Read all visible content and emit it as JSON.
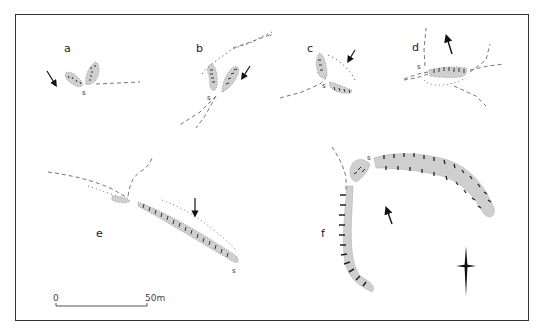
{
  "diagram": {
    "panels": [
      {
        "id": "a",
        "label": "a",
        "marker": "s"
      },
      {
        "id": "b",
        "label": "b",
        "marker": "s"
      },
      {
        "id": "c",
        "label": "c",
        "marker": "s"
      },
      {
        "id": "d",
        "label": "d",
        "marker": "s"
      },
      {
        "id": "e",
        "label": "e",
        "marker": "s"
      },
      {
        "id": "f",
        "label": "f",
        "marker": "s"
      }
    ],
    "scale_bar": {
      "start_label": "0",
      "end_label": "50m"
    },
    "north_arrow": "north-arrow-icon",
    "colors": {
      "fill": "#cfcfcf",
      "hachure": "#222222",
      "frame": "#333333",
      "dashed": "#555555"
    }
  }
}
